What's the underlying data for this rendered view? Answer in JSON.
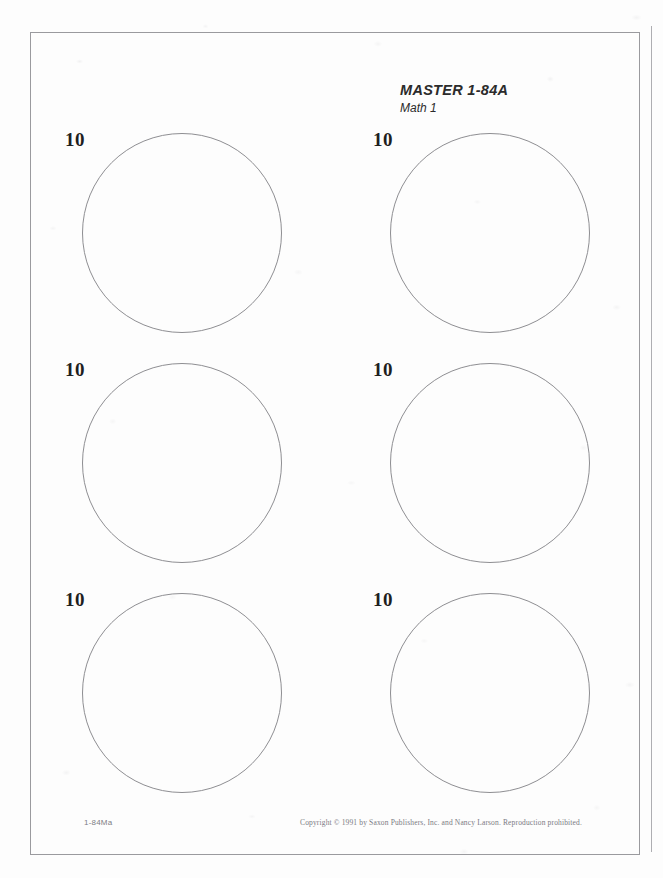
{
  "document": {
    "header": {
      "master_label": "MASTER 1-84A",
      "subject_label": "Math 1"
    },
    "circles": [
      {
        "label": "10",
        "left": 82,
        "top": 133
      },
      {
        "label": "10",
        "left": 390,
        "top": 133
      },
      {
        "label": "10",
        "left": 82,
        "top": 363
      },
      {
        "label": "10",
        "left": 390,
        "top": 363
      },
      {
        "label": "10",
        "left": 82,
        "top": 593
      },
      {
        "label": "10",
        "left": 390,
        "top": 593
      }
    ],
    "footer": {
      "page_code": "1-84Ma",
      "copyright": "Copyright © 1991 by Saxon Publishers, Inc. and Nancy Larson. Reproduction prohibited."
    },
    "colors": {
      "paper": "#fdfdfd",
      "border": "#9a9a9e",
      "circle_outline": "#8e8e92",
      "label_text": "#1f1f1f",
      "footer_text": "#7a7a82"
    }
  }
}
